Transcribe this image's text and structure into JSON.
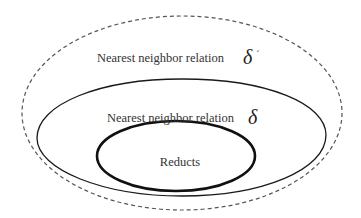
{
  "diagram": {
    "type": "nested-sets",
    "outer_set": {
      "label": "Nearest neighbor relation",
      "symbol": "δ",
      "prime": "´",
      "border": "dashed"
    },
    "middle_set": {
      "label": "Nearest neighbor relation",
      "symbol": "δ",
      "border": "solid"
    },
    "inner_set": {
      "label": "Reducts",
      "border": "thick-solid"
    },
    "colors": {
      "stroke": "#1a1a1a",
      "dashed_stroke": "#555555",
      "text": "#333333",
      "background": "#ffffff"
    }
  }
}
